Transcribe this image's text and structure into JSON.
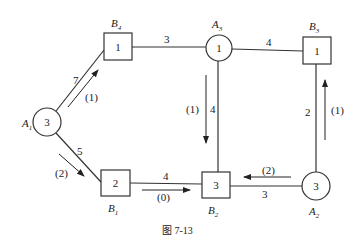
{
  "caption": "图 7-13",
  "nodes": [
    {
      "id": "A1",
      "label": "A",
      "sub": "1",
      "shape": "circle",
      "value": "3",
      "cx": 47,
      "cy": 122,
      "r": 14
    },
    {
      "id": "A2",
      "label": "A",
      "sub": "2",
      "shape": "circle",
      "value": "3",
      "cx": 316,
      "cy": 186,
      "r": 14
    },
    {
      "id": "A3",
      "label": "A",
      "sub": "3",
      "shape": "circle",
      "value": "1",
      "cx": 219,
      "cy": 48,
      "r": 13
    },
    {
      "id": "B1",
      "label": "B",
      "sub": "1",
      "shape": "square",
      "value": "2",
      "x": 101,
      "y": 170,
      "w": 29,
      "h": 26
    },
    {
      "id": "B2",
      "label": "B",
      "sub": "2",
      "shape": "square",
      "value": "3",
      "x": 202,
      "y": 172,
      "w": 28,
      "h": 26
    },
    {
      "id": "B3",
      "label": "B",
      "sub": "3",
      "shape": "square",
      "value": "1",
      "x": 303,
      "y": 37,
      "w": 28,
      "h": 27
    },
    {
      "id": "B4",
      "label": "B",
      "sub": "4",
      "shape": "square",
      "value": "1",
      "x": 104,
      "y": 33,
      "w": 28,
      "h": 27
    }
  ],
  "edges": [
    {
      "from": "A1",
      "to": "B4",
      "cost": "7",
      "flow": "(1)"
    },
    {
      "from": "A1",
      "to": "B1",
      "cost": "5",
      "flow": "(2)"
    },
    {
      "from": "B4",
      "to": "A3",
      "cost": "3",
      "flow": ""
    },
    {
      "from": "A3",
      "to": "B3",
      "cost": "4",
      "flow": ""
    },
    {
      "from": "A3",
      "to": "B2",
      "cost": "4",
      "flow": "(1)"
    },
    {
      "from": "B1",
      "to": "B2",
      "cost": "4",
      "flow": "(0)"
    },
    {
      "from": "A2",
      "to": "B2",
      "cost": "3",
      "flow": "(2)"
    },
    {
      "from": "A2",
      "to": "B3",
      "cost": "2",
      "flow": "(1)"
    }
  ]
}
